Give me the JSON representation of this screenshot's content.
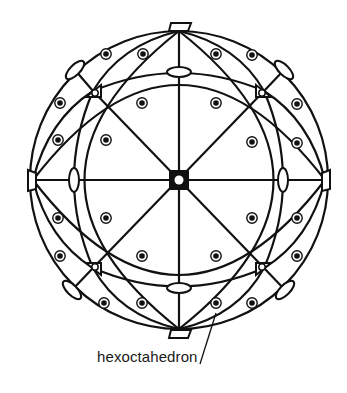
{
  "figure": {
    "label": "hexoctahedron",
    "colors": {
      "line": "#111111",
      "background": "#ffffff"
    },
    "center": [
      179,
      180
    ],
    "radius": 149,
    "symmetry_elements": {
      "four_fold_axes": [
        [
          179,
          180
        ],
        [
          179,
          27
        ],
        [
          179,
          332
        ],
        [
          30,
          180
        ],
        [
          327,
          180
        ]
      ],
      "three_fold_axes": [
        [
          93,
          91
        ],
        [
          264,
          91
        ],
        [
          93,
          268
        ],
        [
          264,
          268
        ]
      ],
      "two_fold_axes": [
        [
          179,
          72
        ],
        [
          179,
          288
        ],
        [
          74,
          180
        ],
        [
          283,
          180
        ],
        [
          75,
          70
        ],
        [
          284,
          70
        ],
        [
          72,
          290
        ],
        [
          285,
          290
        ]
      ]
    },
    "face_poles": [
      [
        106,
        54
      ],
      [
        143,
        54
      ],
      [
        216,
        54
      ],
      [
        252,
        55
      ],
      [
        60,
        103
      ],
      [
        142,
        103
      ],
      [
        216,
        103
      ],
      [
        297,
        104
      ],
      [
        58,
        140
      ],
      [
        106,
        140
      ],
      [
        252,
        142
      ],
      [
        297,
        143
      ],
      [
        58,
        218
      ],
      [
        106,
        218
      ],
      [
        252,
        218
      ],
      [
        297,
        218
      ],
      [
        60,
        256
      ],
      [
        142,
        256
      ],
      [
        216,
        256
      ],
      [
        297,
        256
      ],
      [
        104,
        303
      ],
      [
        142,
        303
      ],
      [
        216,
        303
      ],
      [
        252,
        303
      ]
    ]
  }
}
